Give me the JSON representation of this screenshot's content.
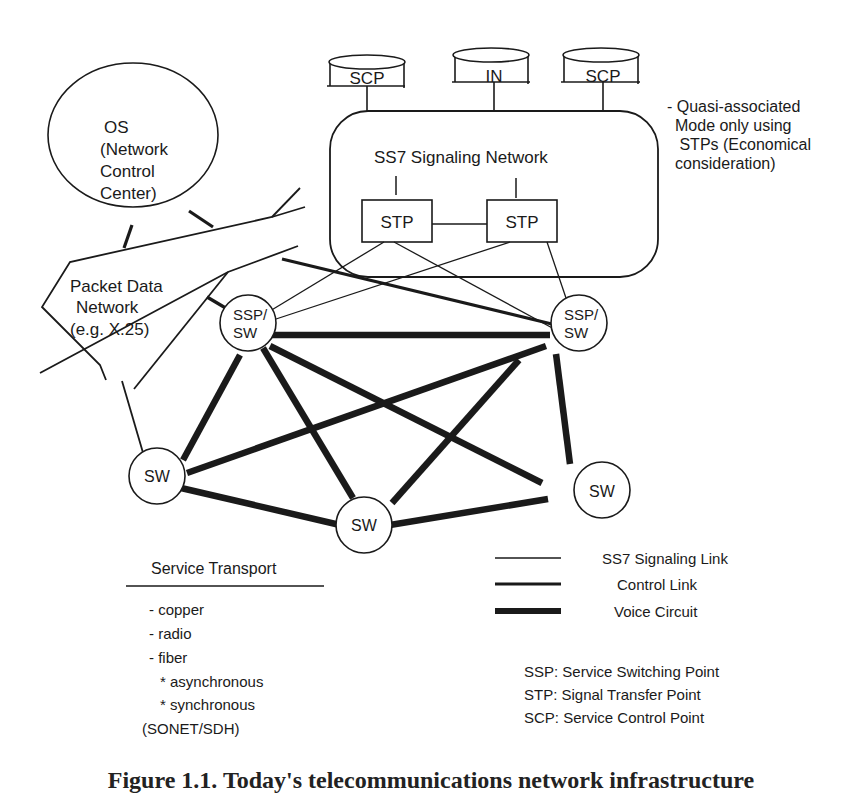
{
  "diagram": {
    "databases": [
      {
        "label": "SCP"
      },
      {
        "label": "IN"
      },
      {
        "label": "SCP"
      }
    ],
    "signaling_network": {
      "title": "SS7 Signaling Network",
      "stps": [
        {
          "label": "STP"
        },
        {
          "label": "STP"
        }
      ]
    },
    "note": {
      "lines": [
        "- Quasi-associated",
        "Mode only using",
        " STPs (Economical",
        "consideration)"
      ]
    },
    "os": {
      "lines": [
        "OS",
        "(Network",
        "Control",
        "Center)"
      ]
    },
    "packet_network": {
      "lines": [
        "Packet Data",
        "Network",
        "(e.g. X.25)"
      ]
    },
    "nodes": [
      {
        "id": "ssp1",
        "lines": [
          "SSP/",
          "SW"
        ]
      },
      {
        "id": "ssp2",
        "lines": [
          "SSP/",
          "SW"
        ]
      },
      {
        "id": "sw1",
        "lines": [
          "SW"
        ]
      },
      {
        "id": "sw2",
        "lines": [
          "SW"
        ]
      },
      {
        "id": "sw3",
        "lines": [
          "SW"
        ]
      }
    ],
    "service_transport": {
      "title": "Service Transport",
      "items": [
        "- copper",
        "- radio",
        "- fiber",
        "* asynchronous",
        "* synchronous",
        "(SONET/SDH)"
      ]
    },
    "legend": [
      {
        "label": "SS7 Signaling Link",
        "weight": "thin"
      },
      {
        "label": "Control Link",
        "weight": "medium"
      },
      {
        "label": "Voice Circuit",
        "weight": "thick"
      }
    ],
    "abbreviations": [
      "SSP: Service Switching Point",
      "STP: Signal Transfer Point",
      "SCP: Service Control Point"
    ],
    "caption": "Figure 1.1. Today's telecommunications network infrastructure"
  }
}
